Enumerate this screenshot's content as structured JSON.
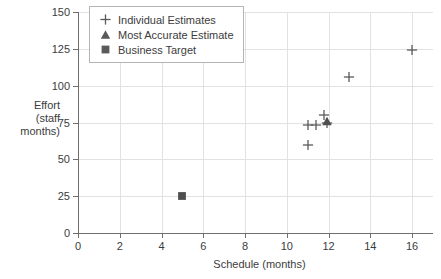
{
  "chart_data": {
    "type": "scatter",
    "title": "",
    "xlabel": "Schedule (months)",
    "ylabel": "Effort (staff months)",
    "ylabel_lines": [
      "Effort",
      "(staff",
      "months)"
    ],
    "xlim": [
      0,
      17
    ],
    "ylim": [
      0,
      150
    ],
    "xticks": [
      0,
      2,
      4,
      6,
      8,
      10,
      12,
      14,
      16
    ],
    "yticks": [
      0,
      25,
      50,
      75,
      100,
      125,
      150
    ],
    "xtick_labels": [
      "0",
      "2",
      "4",
      "6",
      "8",
      "10",
      "12",
      "14",
      "16"
    ],
    "ytick_labels": [
      "0",
      "25",
      "50",
      "75",
      "100",
      "125",
      "150"
    ],
    "grid": true,
    "legend_position": "upper left",
    "series": [
      {
        "name": "Individual Estimates",
        "marker": "plus",
        "color": "#5a5a5a",
        "points": [
          {
            "x": 11.0,
            "y": 60
          },
          {
            "x": 11.0,
            "y": 73
          },
          {
            "x": 11.4,
            "y": 73
          },
          {
            "x": 11.8,
            "y": 80
          },
          {
            "x": 11.9,
            "y": 75
          },
          {
            "x": 13.0,
            "y": 106
          },
          {
            "x": 16.0,
            "y": 124
          }
        ]
      },
      {
        "name": "Most Accurate Estimate",
        "marker": "triangle",
        "color": "#4f4f4f",
        "points": [
          {
            "x": 11.9,
            "y": 76
          }
        ]
      },
      {
        "name": "Business Target",
        "marker": "square",
        "color": "#4f4f4f",
        "points": [
          {
            "x": 5.0,
            "y": 25
          }
        ]
      }
    ]
  },
  "legend": {
    "entries": [
      {
        "label": "Individual Estimates",
        "marker": "plus"
      },
      {
        "label": "Most Accurate Estimate",
        "marker": "triangle"
      },
      {
        "label": "Business Target",
        "marker": "square"
      }
    ]
  },
  "colors": {
    "marker": "#5a5a5a",
    "grid": "#e2e2e2",
    "axis": "#6e6e6e",
    "text": "#3c3c3c",
    "background": "#ffffff",
    "legend_border": "#b4b4b4"
  }
}
